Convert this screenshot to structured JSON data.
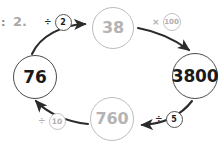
{
  "worksheet": {
    "question_number": "2.",
    "edge_mark": ":"
  },
  "diagram": {
    "type": "cycle-flow",
    "nodes": [
      {
        "id": "n76",
        "value": "76",
        "state": "filled",
        "position": "left"
      },
      {
        "id": "n38",
        "value": "38",
        "state": "hint",
        "position": "top"
      },
      {
        "id": "n3800",
        "value": "3800",
        "state": "filled",
        "position": "right"
      },
      {
        "id": "n760",
        "value": "760",
        "state": "hint",
        "position": "bottom"
      }
    ],
    "operations": [
      {
        "id": "op1",
        "symbol": "÷",
        "operand": "2",
        "style": "dark",
        "from": "n76",
        "to": "n38"
      },
      {
        "id": "op2",
        "symbol": "×",
        "operand": "100",
        "style": "light",
        "from": "n38",
        "to": "n3800"
      },
      {
        "id": "op3",
        "symbol": "÷",
        "operand": "5",
        "style": "dark",
        "from": "n3800",
        "to": "n760"
      },
      {
        "id": "op4",
        "symbol": "÷",
        "operand": "10",
        "style": "light",
        "from": "n760",
        "to": "n76"
      }
    ],
    "colors": {
      "hint_text": "#b4b4b4",
      "filled_text": "#1a1a1a",
      "arrow": "#2b2b2b",
      "hint_circle": "#bdbdbd",
      "filled_circle": "#4a4a4a",
      "background": "#ffffff"
    }
  }
}
